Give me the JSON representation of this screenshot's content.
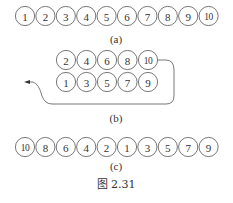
{
  "diagram": {
    "panel_a": {
      "label": "(a)",
      "nodes": [
        "1",
        "2",
        "3",
        "4",
        "5",
        "6",
        "7",
        "8",
        "9",
        "10"
      ]
    },
    "panel_b": {
      "label": "(b)",
      "top_row": [
        "2",
        "4",
        "6",
        "8",
        "10"
      ],
      "bottom_row": [
        "1",
        "3",
        "5",
        "7",
        "9"
      ],
      "connector": "curve from node 10 around right side, under bottom row, to arrow pointing left"
    },
    "panel_c": {
      "label": "(c)",
      "nodes": [
        "10",
        "8",
        "6",
        "4",
        "2",
        "1",
        "3",
        "5",
        "7",
        "9"
      ]
    },
    "caption": "图 2.31"
  }
}
